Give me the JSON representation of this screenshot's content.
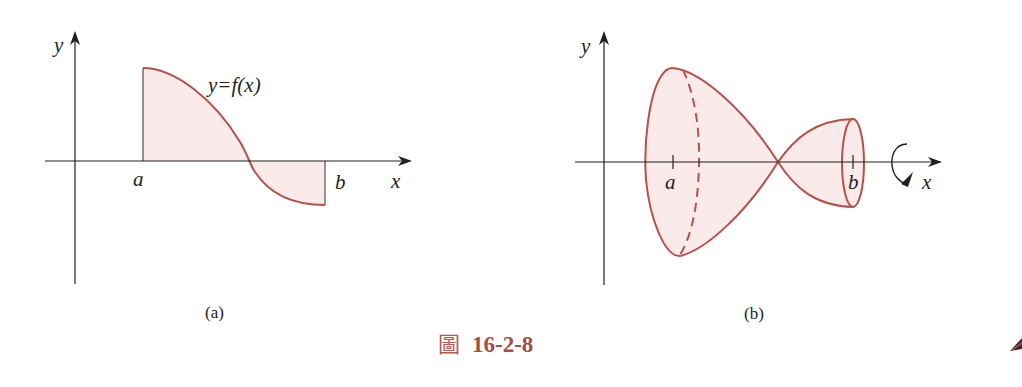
{
  "figure": {
    "caption_prefix": "圖",
    "caption_number": "16-2-8",
    "colors": {
      "curve": "#b5514a",
      "fill": "#fbeaea",
      "axis": "#231f20",
      "caption": "#a24f43"
    }
  },
  "panel_a": {
    "sub_caption": "(a)",
    "y_axis_label": "y",
    "x_axis_label": "x",
    "left_bound_label": "a",
    "right_bound_label": "b",
    "function_label": "y=f(x)"
  },
  "panel_b": {
    "sub_caption": "(b)",
    "y_axis_label": "y",
    "x_axis_label": "x",
    "left_bound_label": "a",
    "right_bound_label": "b",
    "rotation_icon": "rotation-arrow-icon"
  },
  "corner_icon": "pen-icon"
}
